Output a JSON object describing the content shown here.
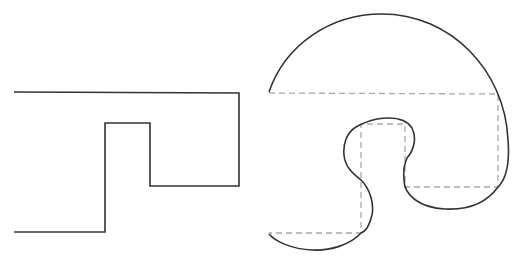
{
  "diagram": {
    "left_figure": {
      "type": "polyline",
      "stroke": "#333333",
      "points": [
        [
          14,
          92
        ],
        [
          239,
          93
        ],
        [
          239,
          186
        ],
        [
          150,
          186
        ],
        [
          150,
          123
        ],
        [
          105,
          123
        ],
        [
          105,
          232
        ],
        [
          14,
          232
        ]
      ]
    },
    "right_figure": {
      "curve_stroke": "#333333",
      "guide_stroke": "#a8a8a8",
      "guide_points": [
        [
          269,
          93
        ],
        [
          498,
          94
        ],
        [
          498,
          187
        ],
        [
          405,
          187
        ],
        [
          405,
          124
        ],
        [
          361,
          124
        ],
        [
          361,
          233
        ],
        [
          269,
          233
        ]
      ]
    },
    "colors": {
      "background": "#ffffff",
      "solid_line": "#333333",
      "dashed_line": "#a8a8a8"
    }
  }
}
